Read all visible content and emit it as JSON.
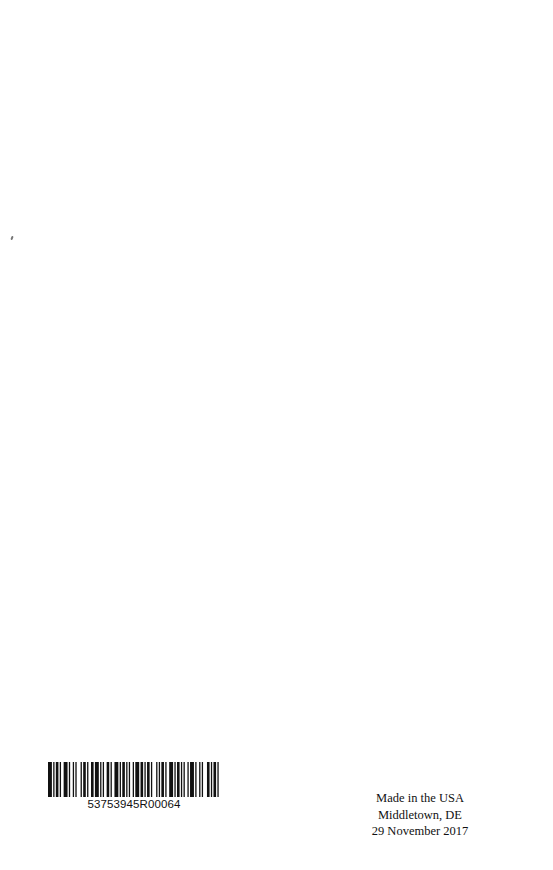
{
  "page": {
    "background": "#ffffff"
  },
  "barcode": {
    "number": "53753945R00064",
    "bar_pattern": [
      3,
      1,
      1,
      1,
      2,
      1,
      1,
      2,
      3,
      1,
      1,
      2,
      1,
      1,
      1,
      3,
      1,
      1,
      2,
      1,
      1,
      2,
      2,
      1,
      3,
      1,
      1,
      1,
      1,
      2,
      2,
      1,
      1,
      2,
      3,
      1,
      1,
      1,
      2,
      1,
      1,
      1,
      1,
      2,
      1,
      1,
      3,
      1,
      2,
      1,
      1,
      1,
      2,
      1,
      1,
      3,
      1,
      1,
      1,
      1,
      2,
      1,
      1,
      2,
      3,
      1,
      1,
      1,
      2,
      1,
      1,
      1,
      1,
      2,
      1,
      1,
      3,
      1,
      1,
      2,
      1,
      1,
      1,
      3,
      2,
      1,
      1,
      1,
      2,
      1,
      1,
      1
    ]
  },
  "imprint": {
    "line1": "Made in the USA",
    "line2": "Middletown, DE",
    "line3": "29 November 2017"
  }
}
